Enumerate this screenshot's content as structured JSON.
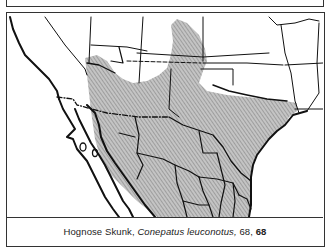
{
  "figure": {
    "caption": {
      "common_name": "Hognose Skunk,",
      "scientific_name": "Conepatus leuconotus,",
      "page_ref": "68,",
      "plate_ref": "68"
    },
    "map": {
      "subject": "range map",
      "range_shading": "diagonal gray hatching",
      "colors": {
        "range_fill": "#b5b5b5",
        "hatch": "#8a8a8a",
        "border_lines": "#111111",
        "background": "#ffffff"
      }
    }
  }
}
